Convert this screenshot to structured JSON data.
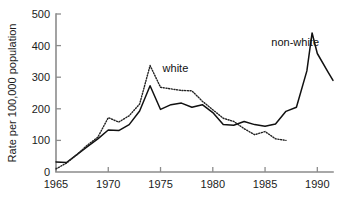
{
  "chart_data": {
    "type": "line",
    "title": "",
    "xlabel": "",
    "ylabel": "Rate per 100,000 population",
    "xlim": [
      1965,
      1991.5
    ],
    "ylim": [
      0,
      500
    ],
    "xticks": [
      1965,
      1970,
      1975,
      1980,
      1985,
      1990
    ],
    "xtick_labels": [
      "1965",
      "1970",
      "1975",
      "1980",
      "1985",
      "1990"
    ],
    "yticks": [
      0,
      100,
      200,
      300,
      400,
      500
    ],
    "ytick_labels": [
      "0",
      "100",
      "200",
      "300",
      "400",
      "500"
    ],
    "grid": false,
    "legend": "inline-annotations",
    "series": [
      {
        "name": "non-white",
        "style": "solid",
        "color": "#111111",
        "label_text": "non-white",
        "x": [
          1965,
          1966,
          1967,
          1968,
          1969,
          1970,
          1971,
          1972,
          1973,
          1974,
          1975,
          1976,
          1977,
          1978,
          1979,
          1980,
          1981,
          1982,
          1983,
          1984,
          1985,
          1986,
          1987,
          1988,
          1989,
          1989.5,
          1990,
          1991,
          1991.5
        ],
        "values": [
          32,
          30,
          55,
          80,
          105,
          133,
          131,
          150,
          193,
          273,
          198,
          213,
          218,
          205,
          213,
          188,
          150,
          148,
          160,
          150,
          145,
          152,
          192,
          205,
          320,
          440,
          375,
          318,
          290
        ]
      },
      {
        "name": "white",
        "style": "dotted",
        "color": "#222222",
        "label_text": "white",
        "x": [
          1965,
          1966,
          1967,
          1968,
          1969,
          1970,
          1971,
          1972,
          1973,
          1974,
          1975,
          1976,
          1977,
          1978,
          1979,
          1980,
          1981,
          1982,
          1983,
          1984,
          1985,
          1986,
          1987
        ],
        "values": [
          10,
          28,
          55,
          85,
          110,
          172,
          158,
          178,
          215,
          337,
          268,
          263,
          258,
          257,
          224,
          197,
          170,
          160,
          137,
          118,
          128,
          105,
          100
        ]
      }
    ],
    "annotations": [
      {
        "text": "white",
        "x": 1975.2,
        "y": 318
      },
      {
        "text": "non-white",
        "x": 1985.6,
        "y": 400
      }
    ]
  }
}
